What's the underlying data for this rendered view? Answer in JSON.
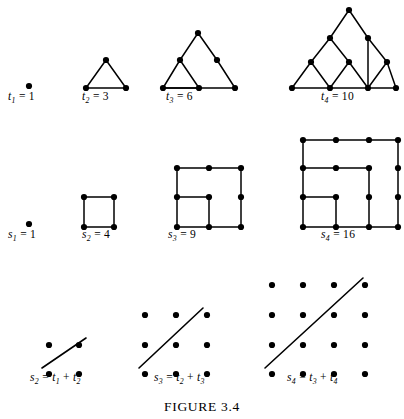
{
  "figure": {
    "caption": "FIGURE 3.4",
    "caption_y": 399
  },
  "colors": {
    "ink": "#000000",
    "background": "#ffffff"
  },
  "chart_data": {
    "type": "diagram",
    "title": "FIGURE 3.4",
    "rows": [
      {
        "name": "triangular-numbers",
        "label_baseline_y": 101,
        "items": [
          {
            "id": "t1",
            "label": "t",
            "sub": "1",
            "eq": "= 1",
            "value": 1,
            "label_x": 8,
            "dot_radius": 3.1,
            "dots": [
              [
                29,
                86
              ]
            ],
            "edges": []
          },
          {
            "id": "t2",
            "label": "t",
            "sub": "2",
            "eq": "= 3",
            "value": 3,
            "label_x": 82,
            "dot_radius": 3.1,
            "dots": [
              [
                106,
                60
              ],
              [
                86,
                88
              ],
              [
                126,
                88
              ]
            ],
            "edges": [
              [
                0,
                1
              ],
              [
                1,
                2
              ],
              [
                2,
                0
              ]
            ]
          },
          {
            "id": "t3",
            "label": "t",
            "sub": "3",
            "eq": "= 6",
            "value": 6,
            "label_x": 166,
            "dot_radius": 3.1,
            "dots": [
              [
                198,
                33
              ],
              [
                180,
                60
              ],
              [
                217,
                60
              ],
              [
                163,
                88
              ],
              [
                199,
                88
              ],
              [
                235,
                88
              ]
            ],
            "edges": [
              [
                0,
                1
              ],
              [
                1,
                3
              ],
              [
                0,
                2
              ],
              [
                2,
                5
              ],
              [
                3,
                5
              ],
              [
                1,
                4
              ],
              [
                3,
                4
              ]
            ]
          },
          {
            "id": "t4",
            "label": "t",
            "sub": "4",
            "eq": "= 10",
            "value": 10,
            "label_x": 321,
            "dot_radius": 3.1,
            "dots": [
              [
                349,
                10
              ],
              [
                330,
                38
              ],
              [
                368,
                38
              ],
              [
                311,
                62
              ],
              [
                349,
                62
              ],
              [
                387,
                62
              ],
              [
                292,
                88
              ],
              [
                330,
                88
              ],
              [
                368,
                88
              ],
              [
                396,
                88
              ]
            ],
            "edges": [
              [
                0,
                1
              ],
              [
                1,
                3
              ],
              [
                3,
                6
              ],
              [
                0,
                2
              ],
              [
                2,
                5
              ],
              [
                5,
                9
              ],
              [
                6,
                9
              ],
              [
                1,
                4
              ],
              [
                4,
                7
              ],
              [
                3,
                7
              ],
              [
                4,
                8
              ],
              [
                2,
                8
              ],
              [
                8,
                5
              ]
            ]
          }
        ]
      },
      {
        "name": "square-numbers",
        "label_baseline_y": 239,
        "items": [
          {
            "id": "s1",
            "label": "s",
            "sub": "1",
            "eq": "= 1",
            "value": 1,
            "label_x": 8,
            "dot_radius": 3.1,
            "dots": [
              [
                29,
                224
              ]
            ],
            "edges": []
          },
          {
            "id": "s2",
            "label": "s",
            "sub": "2",
            "eq": "= 4",
            "value": 4,
            "label_x": 82,
            "dot_radius": 3.1,
            "dots": [
              [
                84,
                197
              ],
              [
                114,
                197
              ],
              [
                84,
                227
              ],
              [
                114,
                227
              ]
            ],
            "edges": [
              [
                0,
                1
              ],
              [
                1,
                3
              ],
              [
                3,
                2
              ],
              [
                2,
                0
              ]
            ]
          },
          {
            "id": "s3",
            "label": "s",
            "sub": "3",
            "eq": "= 9",
            "value": 9,
            "label_x": 168,
            "dot_radius": 3.1,
            "dots": [
              [
                177,
                168
              ],
              [
                209,
                168
              ],
              [
                241,
                168
              ],
              [
                177,
                197
              ],
              [
                209,
                197
              ],
              [
                241,
                197
              ],
              [
                177,
                227
              ],
              [
                209,
                227
              ],
              [
                241,
                227
              ]
            ],
            "edges": [
              [
                0,
                1
              ],
              [
                1,
                2
              ],
              [
                2,
                5
              ],
              [
                5,
                8
              ],
              [
                8,
                7
              ],
              [
                7,
                6
              ],
              [
                6,
                3
              ],
              [
                3,
                0
              ],
              [
                3,
                4
              ],
              [
                4,
                7
              ]
            ]
          },
          {
            "id": "s4",
            "label": "s",
            "sub": "4",
            "eq": "= 16",
            "value": 16,
            "label_x": 321,
            "dot_radius": 3.1,
            "dots": [
              [
                303,
                140
              ],
              [
                336,
                140
              ],
              [
                369,
                140
              ],
              [
                398,
                140
              ],
              [
                303,
                168
              ],
              [
                336,
                168
              ],
              [
                369,
                168
              ],
              [
                398,
                168
              ],
              [
                303,
                197
              ],
              [
                336,
                197
              ],
              [
                369,
                197
              ],
              [
                398,
                197
              ],
              [
                303,
                227
              ],
              [
                336,
                227
              ],
              [
                369,
                227
              ],
              [
                398,
                227
              ]
            ],
            "edges": [
              [
                0,
                1
              ],
              [
                1,
                2
              ],
              [
                2,
                3
              ],
              [
                3,
                7
              ],
              [
                7,
                11
              ],
              [
                11,
                15
              ],
              [
                15,
                14
              ],
              [
                14,
                13
              ],
              [
                13,
                12
              ],
              [
                12,
                8
              ],
              [
                8,
                4
              ],
              [
                4,
                0
              ],
              [
                4,
                5
              ],
              [
                5,
                6
              ],
              [
                6,
                10
              ],
              [
                10,
                14
              ],
              [
                8,
                9
              ],
              [
                9,
                13
              ]
            ]
          }
        ]
      },
      {
        "name": "sum-identity",
        "label_baseline_y": 382,
        "items": [
          {
            "id": "sum2",
            "label": "s",
            "sub": "2",
            "eq": "= t",
            "eq_sub1": "1",
            "eq_mid": "+ t",
            "eq_sub2": "2",
            "label_x": 30,
            "dot_radius": 3.1,
            "grid_cols": 2,
            "grid_rows": 2,
            "dots": [
              [
                49,
                345
              ],
              [
                79,
                345
              ],
              [
                49,
                374
              ],
              [
                79,
                374
              ]
            ],
            "diagonal": [
              [
                42,
                368
              ],
              [
                86,
                338
              ]
            ]
          },
          {
            "id": "sum3",
            "label": "s",
            "sub": "3",
            "eq": "= t",
            "eq_sub1": "2",
            "eq_mid": "+ t",
            "eq_sub2": "3",
            "label_x": 154,
            "dot_radius": 3.1,
            "grid_cols": 3,
            "grid_rows": 3,
            "dots": [
              [
                145,
                315
              ],
              [
                176,
                315
              ],
              [
                207,
                315
              ],
              [
                145,
                345
              ],
              [
                176,
                345
              ],
              [
                207,
                345
              ],
              [
                145,
                374
              ],
              [
                176,
                374
              ],
              [
                207,
                374
              ]
            ],
            "diagonal": [
              [
                139,
                368
              ],
              [
                203,
                308
              ]
            ]
          },
          {
            "id": "sum4",
            "label": "s",
            "sub": "4",
            "eq": "= t",
            "eq_sub1": "3",
            "eq_mid": "+ t",
            "eq_sub2": "4",
            "label_x": 287,
            "dot_radius": 3.1,
            "grid_cols": 4,
            "grid_rows": 4,
            "dots": [
              [
                272,
                285
              ],
              [
                303,
                285
              ],
              [
                334,
                285
              ],
              [
                365,
                285
              ],
              [
                272,
                315
              ],
              [
                303,
                315
              ],
              [
                334,
                315
              ],
              [
                365,
                315
              ],
              [
                272,
                345
              ],
              [
                303,
                345
              ],
              [
                334,
                345
              ],
              [
                365,
                345
              ],
              [
                272,
                374
              ],
              [
                303,
                374
              ],
              [
                334,
                374
              ],
              [
                365,
                374
              ]
            ],
            "diagonal": [
              [
                265,
                368
              ],
              [
                363,
                278
              ]
            ]
          }
        ]
      }
    ]
  }
}
